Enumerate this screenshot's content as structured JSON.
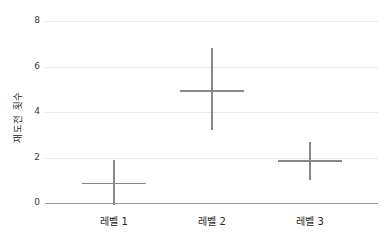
{
  "chart_data": {
    "type": "scatter",
    "subtype": "mean-with-error-bars-crosshair",
    "title": "",
    "xlabel": "",
    "ylabel": "재도전 횟수",
    "categories": [
      "레벨 1",
      "레벨 2",
      "레벨 3"
    ],
    "series": [
      {
        "name": "재도전 횟수",
        "points": [
          {
            "category": "레벨 1",
            "mean": 0.87,
            "upper": 1.88,
            "lower": -0.1
          },
          {
            "category": "레벨 2",
            "mean": 4.92,
            "upper": 6.8,
            "lower": 3.2
          },
          {
            "category": "레벨 3",
            "mean": 1.85,
            "upper": 2.69,
            "lower": 1.0
          }
        ]
      }
    ],
    "ylim": [
      0,
      8
    ],
    "yticks": [
      0,
      2,
      4,
      6,
      8
    ],
    "ytick_labels": [
      "0",
      "2",
      "4",
      "6",
      "8"
    ],
    "marker": "cross",
    "grid": "horizontal",
    "legend": false,
    "colors": {
      "marker": "#888888",
      "gridline": "#e9e9e9",
      "axis_line": "#9a9a9a",
      "tick_label": "#3a3a3a",
      "background": "#ffffff"
    }
  }
}
